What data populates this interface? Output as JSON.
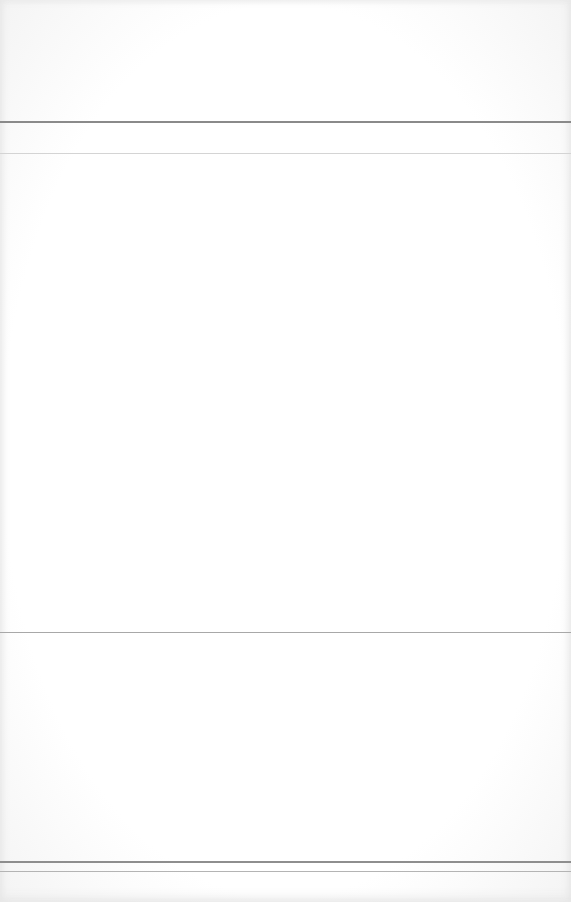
{
  "document": {
    "type": "washed-out scanned page",
    "header_text": "",
    "body_text": "",
    "footer_text": "",
    "colors": {
      "background": "#ffffff",
      "rule_dark": "#8a8a8a",
      "rule_light": "#d4d4d4"
    }
  }
}
